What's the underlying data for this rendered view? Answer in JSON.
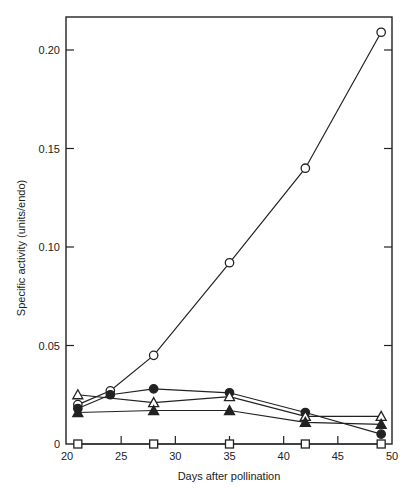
{
  "chart_data": {
    "type": "line",
    "title": "",
    "xlabel": "Days after pollination",
    "ylabel": "Specific activity (units/endo)",
    "xlim": [
      20,
      50
    ],
    "ylim": [
      0,
      0.215
    ],
    "xticks": [
      20,
      25,
      30,
      35,
      40,
      45,
      50
    ],
    "xtick_labels": [
      "20",
      "25",
      "30",
      "35",
      "40",
      "45",
      "50"
    ],
    "yticks": [
      0,
      0.05,
      0.1,
      0.15,
      0.2
    ],
    "ytick_labels": [
      "0",
      "0.05",
      "0.10",
      "0.15",
      "0.20"
    ],
    "grid": false,
    "legend": null,
    "series": [
      {
        "name": "open circle",
        "marker": "circle-open",
        "x": [
          21,
          24,
          28,
          35,
          42,
          49
        ],
        "values": [
          0.02,
          0.027,
          0.045,
          0.092,
          0.14,
          0.209
        ]
      },
      {
        "name": "filled circle",
        "marker": "circle-filled",
        "x": [
          21,
          24,
          28,
          35,
          42,
          49
        ],
        "values": [
          0.018,
          0.025,
          0.028,
          0.026,
          0.016,
          0.005
        ]
      },
      {
        "name": "open triangle",
        "marker": "triangle-open",
        "x": [
          21,
          28,
          35,
          42,
          49
        ],
        "values": [
          0.025,
          0.021,
          0.024,
          0.014,
          0.014
        ]
      },
      {
        "name": "filled triangle",
        "marker": "triangle-filled",
        "x": [
          21,
          28,
          35,
          42,
          49
        ],
        "values": [
          0.016,
          0.017,
          0.017,
          0.011,
          0.01
        ]
      },
      {
        "name": "open square",
        "marker": "square-open",
        "x": [
          21,
          28,
          35,
          42,
          49
        ],
        "values": [
          0,
          0,
          0,
          0,
          0
        ]
      }
    ]
  },
  "colors": {
    "line": "#222222",
    "background": "#ffffff"
  }
}
